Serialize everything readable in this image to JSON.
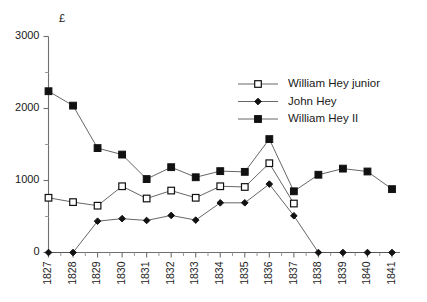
{
  "chart_data": {
    "type": "line",
    "title": "",
    "xlabel": "",
    "ylabel": "£",
    "ylim": [
      0,
      3000
    ],
    "yticks": [
      0,
      1000,
      2000,
      3000
    ],
    "yticks_minor": [
      500,
      1500,
      2500
    ],
    "grid": false,
    "legend_position": "upper-right",
    "categories": [
      "1827",
      "1828",
      "1829",
      "1830",
      "1831",
      "1832",
      "1833",
      "1834",
      "1835",
      "1836",
      "1837",
      "1838",
      "1839",
      "1840",
      "1841"
    ],
    "series": [
      {
        "name": "William Hey junior",
        "marker": "open-square",
        "values": [
          760,
          700,
          650,
          920,
          750,
          860,
          760,
          920,
          910,
          1240,
          680,
          null,
          null,
          null,
          null
        ]
      },
      {
        "name": "John Hey",
        "marker": "filled-diamond",
        "values": [
          0,
          0,
          435,
          470,
          445,
          515,
          450,
          690,
          690,
          950,
          510,
          0,
          0,
          0,
          0
        ]
      },
      {
        "name": "William Hey II",
        "marker": "filled-square",
        "values": [
          2240,
          2040,
          1450,
          1360,
          1020,
          1185,
          1045,
          1130,
          1120,
          1575,
          850,
          1080,
          1165,
          1125,
          880
        ]
      }
    ]
  },
  "legend": {
    "items": [
      {
        "label": "William Hey junior",
        "marker": "open-square"
      },
      {
        "label": "John Hey",
        "marker": "filled-diamond"
      },
      {
        "label": "William Hey II",
        "marker": "filled-square"
      }
    ]
  },
  "colors": {
    "line": "#555555",
    "axis": "#6f6f6f",
    "marker_fill": "#111111",
    "marker_open_fill": "#ffffff",
    "text": "#1a1a1a",
    "background": "#ffffff"
  }
}
